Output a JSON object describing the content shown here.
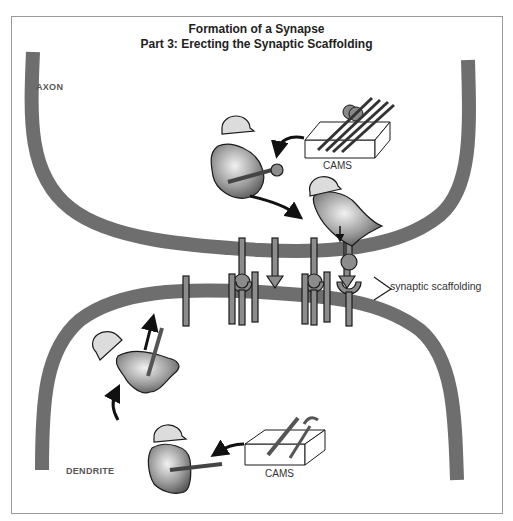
{
  "title": {
    "line1": "Formation of a Synapse",
    "line2": "Part 3: Erecting the Synaptic Scaffolding"
  },
  "labels": {
    "axon": "AXON",
    "dendrite": "DENDRITE",
    "cams_top": "CAMS",
    "cams_bottom": "CAMS",
    "synaptic_scaffolding": "synaptic scaffolding"
  },
  "colors": {
    "membrane": "#6e6e6e",
    "protein_fill": "#8c8c8c",
    "outline": "#1a1a1a",
    "worker_fill": "#9a9a9a",
    "helmet_fill": "#dcdcdc"
  },
  "scaffolding": {
    "top_stalks": [
      {
        "type": "ball",
        "x": 242
      },
      {
        "type": "arrow",
        "x": 275
      },
      {
        "type": "ball",
        "x": 314
      },
      {
        "type": "arrow",
        "x": 347
      },
      {
        "type": "ball-held",
        "x": 380
      }
    ],
    "bottom_elements": [
      "bar",
      "cup",
      "bar",
      "bar",
      "cup",
      "bar",
      "bar",
      "cup"
    ]
  },
  "workers": [
    {
      "id": "worker-axon-1",
      "action": "carrying CAM with ball"
    },
    {
      "id": "worker-axon-2",
      "action": "inserting CAM into axon membrane"
    },
    {
      "id": "worker-dendrite-1",
      "action": "inserting CAM into dendrite membrane"
    },
    {
      "id": "worker-dendrite-2",
      "action": "carrying CAM bar"
    }
  ]
}
